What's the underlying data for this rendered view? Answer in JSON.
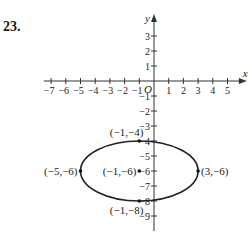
{
  "problem_number": "23.",
  "chart_data": {
    "type": "line",
    "title": "",
    "xlabel": "x",
    "ylabel": "y",
    "origin_label": "O",
    "xlim": [
      -7.5,
      5.5
    ],
    "ylim": [
      -10,
      3.8
    ],
    "x_ticks": [
      -7,
      -6,
      -5,
      -4,
      -3,
      -2,
      -1,
      1,
      2,
      3,
      4,
      5
    ],
    "y_ticks": [
      3,
      2,
      1,
      -1,
      -2,
      -3,
      -4,
      -5,
      -6,
      -7,
      -8,
      -9
    ],
    "grid": false,
    "ellipse": {
      "center": [
        -1,
        -6
      ],
      "rx": 4,
      "ry": 2
    },
    "points": [
      {
        "x": -1,
        "y": -4,
        "label": "(−1,−4)",
        "anchor": "above-left"
      },
      {
        "x": -5,
        "y": -6,
        "label": "(−5,−6)",
        "anchor": "left"
      },
      {
        "x": -1,
        "y": -6,
        "label": "(−1,−6)",
        "anchor": "left"
      },
      {
        "x": 3,
        "y": -6,
        "label": "(3,−6)",
        "anchor": "right"
      },
      {
        "x": -1,
        "y": -8,
        "label": "(−1,−8)",
        "anchor": "below-left"
      }
    ]
  }
}
